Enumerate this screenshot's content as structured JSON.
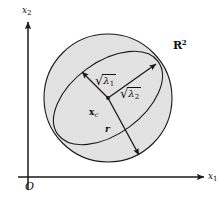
{
  "figure": {
    "background_color": "#ffffff",
    "stroke_color": "#1a1a1a",
    "fill_color": "#e2e2e2"
  },
  "axes": {
    "x_label_main": "x",
    "x_label_sub": "1",
    "y_label_main": "x",
    "y_label_sub": "2",
    "origin_label": "O",
    "x_axis_start": {
      "x": 18,
      "y": 177
    },
    "x_axis_end": {
      "x": 206,
      "y": 177
    },
    "y_axis_start": {
      "x": 28,
      "y": 190
    },
    "y_axis_end": {
      "x": 28,
      "y": 20
    }
  },
  "space_label": {
    "base": "R",
    "exponent": "2"
  },
  "circle": {
    "center_x": 108,
    "center_y": 98,
    "radius": 64,
    "label": "bounding-circle"
  },
  "ellipse": {
    "center_x": 108,
    "center_y": 98,
    "semi_major": 62,
    "semi_minor": 36,
    "rotation_deg": -36,
    "label": "confidence-ellipse"
  },
  "center_point": {
    "label_base": "x",
    "label_sub": "c",
    "x": 108,
    "y": 98
  },
  "vectors": [
    {
      "name": "sqrt-lambda-1",
      "symbol": "√",
      "base": "λ",
      "sub": "1",
      "from": {
        "x": 108,
        "y": 98
      },
      "to": {
        "x": 80,
        "y": 70
      },
      "label_x": 96,
      "label_y": 75
    },
    {
      "name": "sqrt-lambda-2",
      "symbol": "√",
      "base": "λ",
      "sub": "2",
      "from": {
        "x": 108,
        "y": 98
      },
      "to": {
        "x": 158,
        "y": 62
      },
      "label_x": 121,
      "label_y": 88
    },
    {
      "name": "radius-r",
      "symbol": "",
      "base": "r",
      "sub": "",
      "from": {
        "x": 108,
        "y": 98
      },
      "to": {
        "x": 141,
        "y": 158
      },
      "label_x": 106,
      "label_y": 128
    }
  ]
}
